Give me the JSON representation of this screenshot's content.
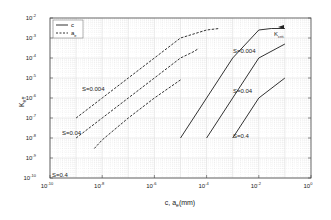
{
  "chart_data": {
    "type": "line",
    "title": "",
    "xlabel": "c, a_e (mm)",
    "ylabel": "K_eff",
    "xscale": "log",
    "yscale": "log",
    "xlim": [
      1e-10,
      1
    ],
    "ylim": [
      1e-10,
      0.01
    ],
    "grid": true,
    "legend_position": "upper left",
    "x_tick_labels": [
      "10^-10",
      "10^-8",
      "10^-6",
      "10^-4",
      "10^-2",
      "10^0"
    ],
    "y_tick_labels": [
      "10^-2",
      "10^-3",
      "10^-4",
      "10^-5",
      "10^-6",
      "10^-7",
      "10^-8",
      "10^-9",
      "10^-10"
    ],
    "legend": [
      {
        "label": "c",
        "style": "solid"
      },
      {
        "label": "a_e",
        "style": "dashed"
      }
    ],
    "series": [
      {
        "name": "c, S=0.004",
        "style": "solid",
        "points": [
          [
            1e-05,
            1e-08
          ],
          [
            0.0001,
            1e-06
          ],
          [
            0.001,
            0.0001
          ],
          [
            0.01,
            0.0025
          ],
          [
            0.03,
            0.003
          ],
          [
            0.1,
            0.003
          ]
        ]
      },
      {
        "name": "c, S=0.04",
        "style": "solid",
        "points": [
          [
            0.0001,
            1e-08
          ],
          [
            0.001,
            1e-06
          ],
          [
            0.01,
            0.0001
          ],
          [
            0.1,
            0.0005
          ]
        ]
      },
      {
        "name": "c, S=0.4",
        "style": "solid",
        "points": [
          [
            0.001,
            1e-08
          ],
          [
            0.01,
            1e-06
          ],
          [
            0.1,
            1e-05
          ]
        ]
      },
      {
        "name": "a_e, S=0.004",
        "style": "dashed",
        "points": [
          [
            1e-09,
            1e-07
          ],
          [
            1e-08,
            1e-06
          ],
          [
            1e-07,
            1e-05
          ],
          [
            1e-06,
            0.0001
          ],
          [
            1e-05,
            0.001
          ],
          [
            0.0001,
            0.0025
          ],
          [
            0.0003,
            0.003
          ]
        ]
      },
      {
        "name": "a_e, S=0.04",
        "style": "dashed",
        "points": [
          [
            1e-09,
            1e-08
          ],
          [
            1e-08,
            1e-07
          ],
          [
            1e-07,
            1e-06
          ],
          [
            1e-06,
            1e-05
          ],
          [
            1e-05,
            0.0001
          ],
          [
            3e-05,
            0.0002
          ],
          [
            5e-05,
            0.0003
          ]
        ]
      },
      {
        "name": "a_e, S=0.4",
        "style": "dashed",
        "points": [
          [
            5e-09,
            3e-09
          ],
          [
            1e-08,
            8e-09
          ],
          [
            1e-07,
            1e-07
          ],
          [
            1e-06,
            1e-06
          ],
          [
            1e-05,
            8e-06
          ]
        ]
      }
    ],
    "annotations": [
      {
        "text": "S=0.004",
        "x": 1e-09,
        "y": 1e-06
      },
      {
        "text": "S=0.04",
        "x": 1e-09,
        "y": 1e-08
      },
      {
        "text": "S=0.4",
        "x": 1e-10,
        "y": 3e-10
      },
      {
        "text": "S=0.004",
        "x": 0.004,
        "y": 2e-05
      },
      {
        "text": "S=0.04",
        "x": 0.004,
        "y": 3e-07
      },
      {
        "text": "S=0.4",
        "x": 0.004,
        "y": 5e-09
      },
      {
        "text": "K_crit",
        "x": 0.1,
        "y": 0.001
      }
    ]
  },
  "labels": {
    "xlabel_main": "c, a",
    "xlabel_sub": "e",
    "xlabel_tail": "(mm)",
    "ylabel_main": "K",
    "ylabel_sub": "eff",
    "legend_c": "c",
    "legend_ae_main": "a",
    "legend_ae_sub": "e",
    "kcrit_main": "K",
    "kcrit_sub": "crit.",
    "ann_dash_s1": "S=0.004",
    "ann_dash_s2": "S=0.04",
    "ann_dash_s3": "S=0.4",
    "ann_solid_s1": "S=0.004",
    "ann_solid_s2": "S=0.04",
    "ann_solid_s3": "S=0.4"
  },
  "colors": {
    "line": "#333333",
    "grid": "#d8d8d8",
    "axis": "#444444"
  }
}
